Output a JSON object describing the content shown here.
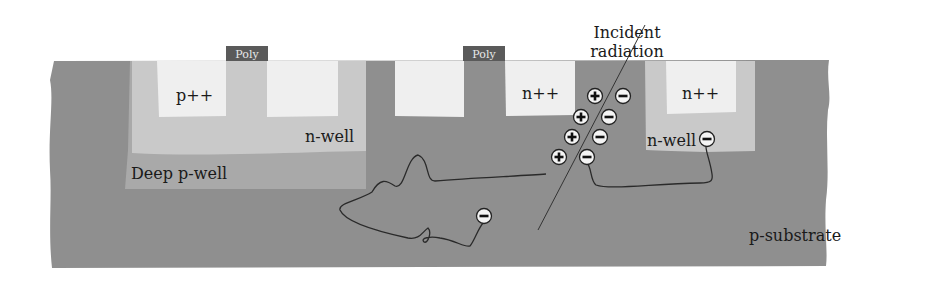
{
  "figure": {
    "type": "cross-section diagram",
    "colors": {
      "substrate": "#8f8f8f",
      "n_well": "#c9c9c9",
      "deep_p_well": "#a9a9a9",
      "diffusion": "#efefef",
      "poly": "#5a5a5a",
      "trajectory": "#2a2a2a",
      "background": "#ffffff"
    }
  },
  "labels": {
    "poly_left": "Poly",
    "poly_right": "Poly",
    "p_plus_plus": "p++",
    "n_well_left": "n-well",
    "deep_p_well": "Deep p-well",
    "n_plus_plus_center": "n++",
    "n_plus_plus_right": "n++",
    "n_well_right": "n-well",
    "incident_line1": "Incident",
    "incident_line2": "radiation",
    "p_substrate": "p-substrate"
  },
  "charges": {
    "holes": [
      {
        "symbol": "+",
        "x": 595,
        "y": 96
      },
      {
        "symbol": "+",
        "x": 581,
        "y": 117
      },
      {
        "symbol": "+",
        "x": 572,
        "y": 137
      },
      {
        "symbol": "+",
        "x": 559,
        "y": 157
      }
    ],
    "electrons": [
      {
        "symbol": "−",
        "x": 623,
        "y": 96
      },
      {
        "symbol": "−",
        "x": 609,
        "y": 117
      },
      {
        "symbol": "−",
        "x": 600,
        "y": 137
      },
      {
        "symbol": "−",
        "x": 587,
        "y": 157
      },
      {
        "symbol": "−",
        "x": 707,
        "y": 139
      },
      {
        "symbol": "−",
        "x": 484,
        "y": 216
      }
    ]
  }
}
